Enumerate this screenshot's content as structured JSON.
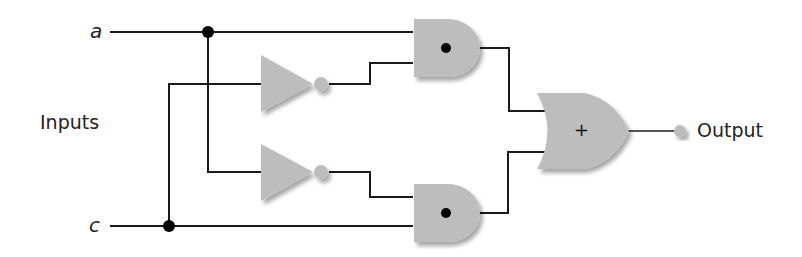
{
  "diagram": {
    "type": "logic-circuit",
    "labels": {
      "input_a": "a",
      "input_c": "c",
      "inputs": "Inputs",
      "output": "Output",
      "or_symbol": "+"
    },
    "gates": [
      {
        "id": "not1",
        "type": "NOT",
        "input": "c"
      },
      {
        "id": "not2",
        "type": "NOT",
        "input": "a"
      },
      {
        "id": "and1",
        "type": "AND",
        "symbol": "•",
        "inputs": [
          "a",
          "not1"
        ]
      },
      {
        "id": "and2",
        "type": "AND",
        "symbol": "•",
        "inputs": [
          "not2",
          "c"
        ]
      },
      {
        "id": "or1",
        "type": "OR",
        "symbol": "+",
        "inputs": [
          "and1",
          "and2"
        ]
      }
    ],
    "expression": "a·c' + a'·c",
    "colors": {
      "gate_fill": "#bdbdbd",
      "wire": "#1a1a1a",
      "background": "#ffffff"
    }
  }
}
